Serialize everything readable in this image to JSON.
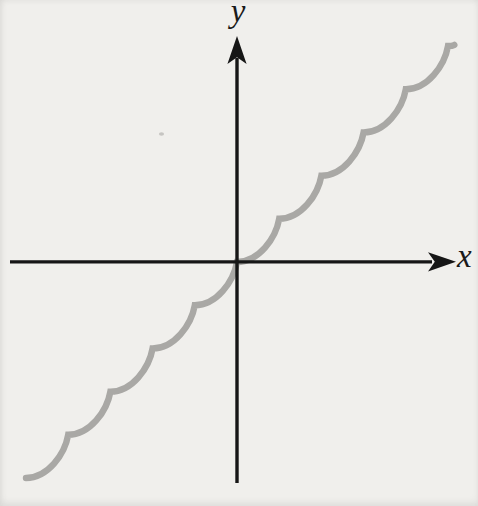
{
  "figure": {
    "kind": "textbook-math-figure",
    "background_color": "#f0efec",
    "axes": {
      "x_label": "x",
      "y_label": "y",
      "color": "#161616",
      "arrowheads": [
        "positive-x",
        "positive-y"
      ],
      "tick_labels": "none"
    },
    "curve_color": "#a9a8a5",
    "speck_color": "#c6c5c2"
  },
  "chart_data": {
    "type": "line",
    "title": "",
    "xlabel": "x",
    "ylabel": "y",
    "x_range": [
      -5.6,
      5.7
    ],
    "y_range": [
      -5.7,
      6.0
    ],
    "grid": false,
    "legend": false,
    "series": [
      {
        "name": "scalloped-curve",
        "color": "#a9a8a5",
        "cusps": [
          [
            -5,
            -5
          ],
          [
            -4,
            -4
          ],
          [
            -3,
            -3
          ],
          [
            -2,
            -2
          ],
          [
            -1,
            -1
          ],
          [
            0,
            0
          ],
          [
            1,
            1
          ],
          [
            2,
            2
          ],
          [
            3,
            3
          ],
          [
            4,
            4
          ],
          [
            5,
            5
          ]
        ],
        "end_stub_units": 0.15,
        "piece_shape": "flat tangent at left cusp, concave up, steep at right cusp"
      }
    ]
  }
}
